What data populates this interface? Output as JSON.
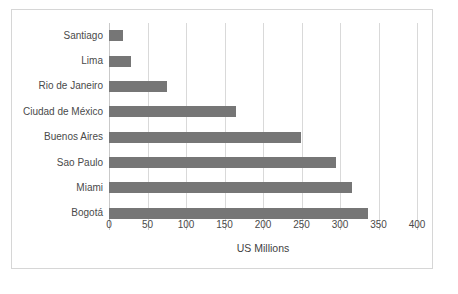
{
  "chart_data": {
    "type": "bar",
    "orientation": "horizontal",
    "title": "",
    "xlabel": "US Millions",
    "ylabel": "",
    "categories": [
      "Santiago",
      "Lima",
      "Rio de Janeiro",
      "Ciudad de México",
      "Buenos Aires",
      "Sao Paulo",
      "Miami",
      "Bogotá"
    ],
    "values": [
      18,
      28,
      75,
      165,
      249,
      295,
      315,
      337
    ],
    "xlim": [
      0,
      400
    ],
    "xticks": [
      0,
      50,
      100,
      150,
      200,
      250,
      300,
      350,
      400
    ],
    "xtick_labels": [
      "0",
      "50",
      "100",
      "150",
      "200",
      "250",
      "300",
      "350",
      "400"
    ],
    "grid": "vertical",
    "legend": "none",
    "bar_color": "#767676",
    "grid_color": "#d9d9d9",
    "border_color": "#d6d6d6",
    "text_color": "#4a4a4a"
  }
}
